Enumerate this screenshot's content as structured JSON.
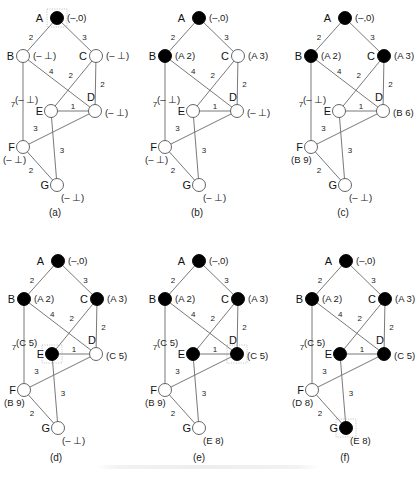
{
  "figure": {
    "colors": {
      "visited": "#000000",
      "unvisited": "#ffffff",
      "edge": "#6a6a6a"
    }
  },
  "graph": {
    "nodes": [
      {
        "id": "A",
        "x": 57,
        "y": 18
      },
      {
        "id": "B",
        "x": 23,
        "y": 56
      },
      {
        "id": "C",
        "x": 96,
        "y": 56
      },
      {
        "id": "D",
        "x": 95,
        "y": 111
      },
      {
        "id": "E",
        "x": 51,
        "y": 111
      },
      {
        "id": "F",
        "x": 23,
        "y": 147
      },
      {
        "id": "G",
        "x": 57,
        "y": 185
      }
    ],
    "edges": [
      {
        "from": "A",
        "to": "B",
        "weight": "2"
      },
      {
        "from": "A",
        "to": "C",
        "weight": "3"
      },
      {
        "from": "B",
        "to": "D",
        "weight": "4"
      },
      {
        "from": "B",
        "to": "F",
        "weight": "7"
      },
      {
        "from": "C",
        "to": "E",
        "weight": "2"
      },
      {
        "from": "C",
        "to": "D",
        "weight": "2"
      },
      {
        "from": "E",
        "to": "D",
        "weight": "1"
      },
      {
        "from": "E",
        "to": "G",
        "weight": "3"
      },
      {
        "from": "D",
        "to": "F",
        "weight": "3"
      },
      {
        "from": "F",
        "to": "G",
        "weight": "2"
      }
    ]
  },
  "panels": [
    {
      "caption": "(a)",
      "selected": "A",
      "visited": [
        "A"
      ],
      "labels": {
        "A": "(–,0)",
        "B": "(– ⊥)",
        "C": "(– ⊥)",
        "D": "(– ⊥)",
        "E": "(– ⊥)",
        "F": "(– ⊥)",
        "G": "(– ⊥)"
      }
    },
    {
      "caption": "(b)",
      "selected": "",
      "visited": [
        "A",
        "B"
      ],
      "labels": {
        "A": "(–,0)",
        "B": "(A 2)",
        "C": "(A 3)",
        "D": "(– ⊥)",
        "E": "(– ⊥)",
        "F": "(– ⊥)",
        "G": "(– ⊥)"
      }
    },
    {
      "caption": "(c)",
      "selected": "",
      "visited": [
        "A",
        "B",
        "C"
      ],
      "labels": {
        "A": "(–,0)",
        "B": "(A 2)",
        "C": "(A 3)",
        "D": "(B 6)",
        "E": "(– ⊥)",
        "F": "(B 9)",
        "G": "(– ⊥)"
      }
    },
    {
      "caption": "(d)",
      "selected": "E",
      "visited": [
        "A",
        "B",
        "C",
        "E"
      ],
      "labels": {
        "A": "(–,0)",
        "B": "(A 2)",
        "C": "(A 3)",
        "D": "(C 5)",
        "E": "(C 5)",
        "F": "(B 9)",
        "G": "(– ⊥)"
      }
    },
    {
      "caption": "(e)",
      "selected": "D",
      "visited": [
        "A",
        "B",
        "C",
        "E",
        "D"
      ],
      "labels": {
        "A": "(–,0)",
        "B": "(A 2)",
        "C": "(A 3)",
        "D": "(C 5)",
        "E": "(C 5)",
        "F": "(B 9)",
        "G": "(E 8)"
      }
    },
    {
      "caption": "(f)",
      "selected": "G",
      "visited": [
        "A",
        "B",
        "C",
        "E",
        "D",
        "G"
      ],
      "labels": {
        "A": "(–,0)",
        "B": "(A 2)",
        "C": "(A 3)",
        "D": "(C 5)",
        "E": "(C 5)",
        "F": "(D 8)",
        "G": "(E 8)"
      }
    }
  ]
}
